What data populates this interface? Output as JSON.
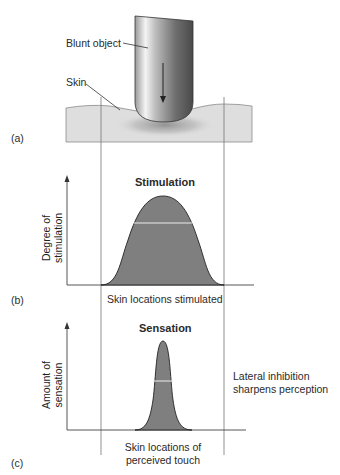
{
  "panel_a": {
    "tag": "(a)",
    "object_label": "Blunt object",
    "skin_label": "Skin"
  },
  "panel_b": {
    "tag": "(b)",
    "title": "Stimulation",
    "ylabel_line1": "Degree of",
    "ylabel_line2": "stimulation",
    "xlabel": "Skin locations stimulated"
  },
  "panel_c": {
    "tag": "(c)",
    "title": "Sensation",
    "ylabel_line1": "Amount of",
    "ylabel_line2": "sensation",
    "xlabel_line1": "Skin locations of",
    "xlabel_line2": "perceived touch",
    "note_line1": "Lateral inhibition",
    "note_line2": "sharpens perception"
  },
  "colors": {
    "skin_fill": "#dcdcdc",
    "curve_fill": "#7f7f7f",
    "line": "#555555"
  }
}
